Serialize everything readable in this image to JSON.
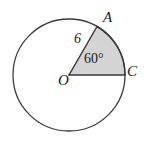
{
  "figure": {
    "type": "circle-sector-diagram",
    "background_color": "#ffffff",
    "stroke_color": "#3a3a3a",
    "sector_fill_color": "#d4d4d4",
    "circle": {
      "center_label": "O",
      "center_x": 69,
      "center_y": 75,
      "radius_px": 56
    },
    "points": {
      "center": "O",
      "arc_start": "A",
      "arc_end": "C"
    },
    "labels": {
      "point_a": "A",
      "point_c": "C",
      "point_o": "O",
      "radius_measure": "6",
      "angle_measure": "60°"
    },
    "sector": {
      "central_angle_degrees": 60,
      "radius_value": 6,
      "start_angle_degrees": 0,
      "end_angle_degrees": 60,
      "shaded": true
    }
  }
}
